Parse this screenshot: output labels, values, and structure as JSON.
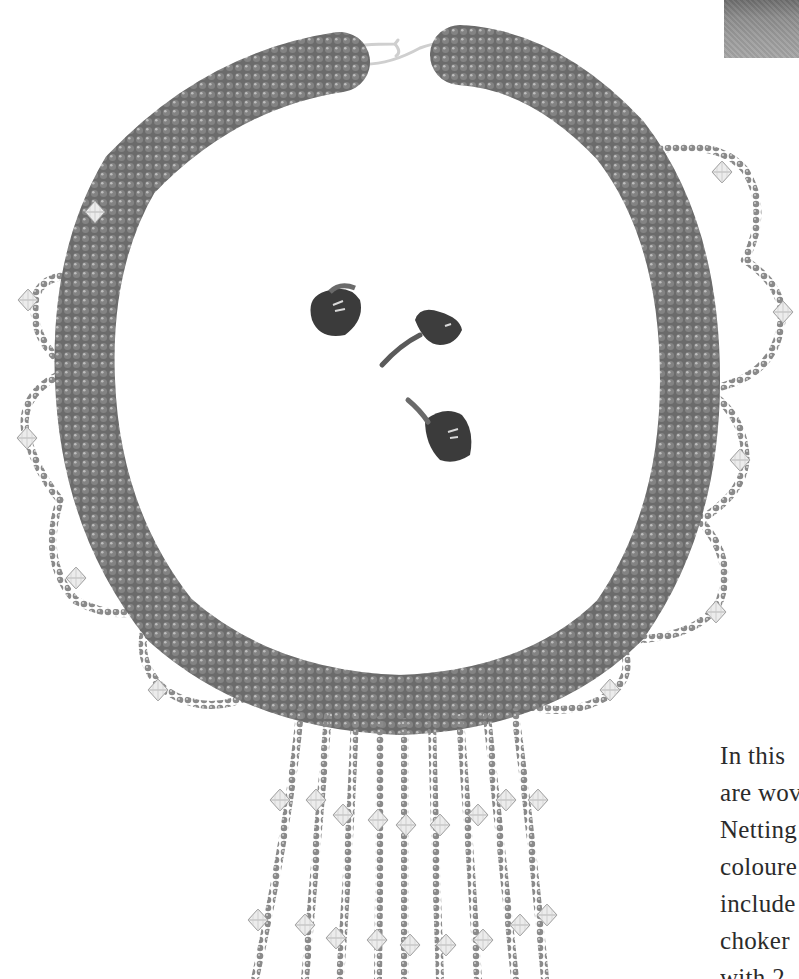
{
  "page": {
    "type": "book-page",
    "figure": {
      "subject": "beaded-necklace-photo",
      "caption_visible": false,
      "elements": [
        "silver-s-hook-clasp",
        "netted-bead-choker-band",
        "crystal-bicone-scallop-loops",
        "crystal-bicone-fringe-strands",
        "three-violet-flowers"
      ],
      "colors": {
        "background": "#ffffff",
        "seed_bead": "#8a8a8a",
        "seed_bead_dark": "#5e5e5e",
        "seed_bead_highlight": "#c9c9c9",
        "crystal": "#e6e6e6",
        "flower": "#3d3d3d",
        "clasp": "#d9d9d9"
      }
    },
    "corner_image": {
      "description": "cropped-grey-photo-corner"
    },
    "body_text": {
      "lines": [
        "In this",
        "are wov",
        "Netting",
        "coloure",
        "include",
        "choker",
        "with 2"
      ]
    }
  }
}
